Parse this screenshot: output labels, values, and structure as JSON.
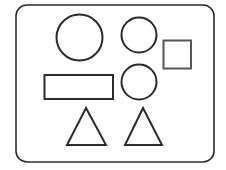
{
  "canvas": {
    "width": 226,
    "height": 170,
    "background": "#ffffff"
  },
  "colors": {
    "stroke": "#2b2b2b",
    "stroke_light": "#555555"
  },
  "frame": {
    "x": 16,
    "y": 5,
    "width": 198,
    "height": 157,
    "rx": 11,
    "stroke_width": 1.6
  },
  "shapes": {
    "large_circle": {
      "type": "circle",
      "cx": 79.5,
      "cy": 37.5,
      "r": 23
    },
    "small_circle_top": {
      "type": "circle",
      "cx": 139,
      "cy": 35,
      "r": 17.5
    },
    "square": {
      "type": "rect",
      "x": 163.5,
      "y": 40.5,
      "width": 27.5,
      "height": 28
    },
    "rectangle": {
      "type": "rect",
      "x": 44.5,
      "y": 75,
      "width": 68.5,
      "height": 24
    },
    "small_circle_middle": {
      "type": "circle",
      "cx": 139,
      "cy": 82,
      "r": 17.5
    },
    "triangle_left": {
      "type": "triangle",
      "points": "86,108 67,145 106,145"
    },
    "triangle_right": {
      "type": "triangle",
      "points": "143,108 125,145 162,145"
    }
  }
}
